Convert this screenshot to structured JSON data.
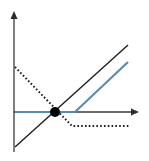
{
  "diagram": {
    "type": "payoff-diagram",
    "colors": {
      "axis": "#3a3a3a",
      "long_line": "#1e1e1e",
      "blue_line": "#5b8bb0",
      "dotted_line": "#1e1e1e",
      "intersection_dot": "#000000",
      "background": "#ffffff"
    },
    "axes": {
      "origin": [
        14,
        112
      ],
      "y_axis_top": [
        14,
        12
      ],
      "y_axis_bottom": [
        14,
        152
      ],
      "x_axis_right": [
        138,
        112
      ]
    },
    "series": [
      {
        "name": "diagonal-line",
        "style": "solid",
        "points": [
          [
            15,
            147
          ],
          [
            128,
            45
          ]
        ]
      },
      {
        "name": "blue-kinked-line",
        "style": "solid",
        "points": [
          [
            15,
            112
          ],
          [
            75,
            112
          ],
          [
            128,
            62
          ]
        ]
      },
      {
        "name": "dotted-line",
        "style": "dotted",
        "points": [
          [
            15,
            67
          ],
          [
            72,
            126
          ],
          [
            129,
            126
          ]
        ]
      }
    ],
    "intersection": {
      "center": [
        55,
        112
      ],
      "radius": 5
    }
  }
}
